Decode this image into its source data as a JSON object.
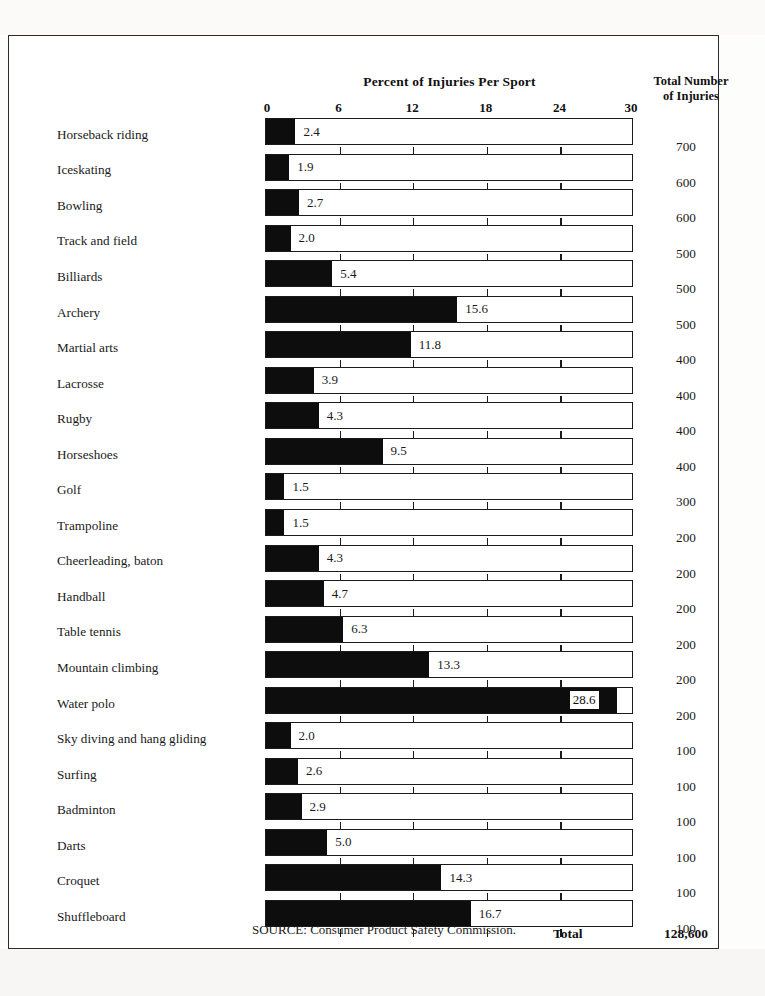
{
  "chart_data": {
    "type": "bar",
    "title": "Percent of Injuries Per Sport",
    "xlabel": "",
    "ylabel": "",
    "xlim": [
      0,
      30
    ],
    "xticks": [
      0,
      6,
      12,
      18,
      24,
      30
    ],
    "grid": true,
    "orientation": "horizontal",
    "value_column_header_line1": "Total Number",
    "value_column_header_line2": "of Injuries",
    "categories": [
      "Horseback riding",
      "Iceskating",
      "Bowling",
      "Track and field",
      "Billiards",
      "Archery",
      "Martial arts",
      "Lacrosse",
      "Rugby",
      "Horseshoes",
      "Golf",
      "Trampoline",
      "Cheerleading, baton",
      "Handball",
      "Table tennis",
      "Mountain climbing",
      "Water polo",
      "Sky diving and hang gliding",
      "Surfing",
      "Badminton",
      "Darts",
      "Croquet",
      "Shuffleboard"
    ],
    "values": [
      2.4,
      1.9,
      2.7,
      2.0,
      5.4,
      15.6,
      11.8,
      3.9,
      4.3,
      9.5,
      1.5,
      1.5,
      4.3,
      4.7,
      6.3,
      13.3,
      28.6,
      2.0,
      2.6,
      2.9,
      5.0,
      14.3,
      16.7
    ],
    "value_labels": [
      "2.4",
      "1.9",
      "2.7",
      "2.0",
      "5.4",
      "15.6",
      "11.8",
      "3.9",
      "4.3",
      "9.5",
      "1.5",
      "1.5",
      "4.3",
      "4.7",
      "6.3",
      "13.3",
      "28.6",
      "2.0",
      "2.6",
      "2.9",
      "5.0",
      "14.3",
      "16.7"
    ],
    "totals": [
      "700",
      "600",
      "600",
      "500",
      "500",
      "500",
      "400",
      "400",
      "400",
      "400",
      "300",
      "200",
      "200",
      "200",
      "200",
      "200",
      "200",
      "100",
      "100",
      "100",
      "100",
      "100",
      "100"
    ],
    "total_label": "Total",
    "total_value": "128,600",
    "source": "SOURCE: Consumer Product Safety Commission.",
    "colors": {
      "bar_fill": "#0d0d0d",
      "bar_outline": "#1b1b1b",
      "background": "#ffffff",
      "text": "#1a1a1a"
    }
  }
}
